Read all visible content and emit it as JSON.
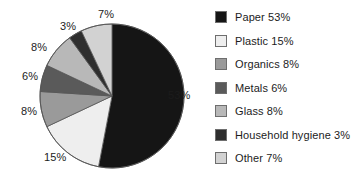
{
  "chart_data": {
    "type": "pie",
    "title": "",
    "subtitle": "",
    "xlabel": "",
    "ylabel": "",
    "legend_position": "right",
    "grid": false,
    "start_angle_deg": 0,
    "direction": "clockwise",
    "unit": "%",
    "categories": [
      "Paper",
      "Plastic",
      "Organics",
      "Metals",
      "Glass",
      "Household hygiene",
      "Other"
    ],
    "values": [
      53,
      15,
      8,
      6,
      8,
      3,
      7
    ],
    "total": 100,
    "colors": [
      "#151515",
      "#eeeeee",
      "#9a9a9a",
      "#5a5a5a",
      "#b8b8b8",
      "#2e2e2e",
      "#d2d2d2"
    ],
    "slices": [
      {
        "label": "Paper",
        "value": 53,
        "value_text": "53%",
        "color": "#151515"
      },
      {
        "label": "Plastic",
        "value": 15,
        "value_text": "15%",
        "color": "#eeeeee"
      },
      {
        "label": "Organics",
        "value": 8,
        "value_text": "8%",
        "color": "#9a9a9a"
      },
      {
        "label": "Metals",
        "value": 6,
        "value_text": "6%",
        "color": "#5a5a5a"
      },
      {
        "label": "Glass",
        "value": 8,
        "value_text": "8%",
        "color": "#b8b8b8"
      },
      {
        "label": "Household hygiene",
        "value": 3,
        "value_text": "3%",
        "color": "#2e2e2e"
      },
      {
        "label": "Other",
        "value": 7,
        "value_text": "7%",
        "color": "#d2d2d2"
      }
    ],
    "data_labels": [
      "53%",
      "15%",
      "8%",
      "6%",
      "8%",
      "3%",
      "7%"
    ],
    "legend_entries": [
      {
        "text": "Paper 53%",
        "color": "#151515"
      },
      {
        "text": "Plastic 15%",
        "color": "#eeeeee"
      },
      {
        "text": "Organics 8%",
        "color": "#9a9a9a"
      },
      {
        "text": "Metals 6%",
        "color": "#5a5a5a"
      },
      {
        "text": "Glass 8%",
        "color": "#b8b8b8"
      },
      {
        "text": "Household hygiene 3%",
        "color": "#2e2e2e"
      },
      {
        "text": "Other 7%",
        "color": "#d2d2d2"
      }
    ]
  },
  "pie_geometry": {
    "cx": 112,
    "cy": 96,
    "r": 72,
    "outline_color": "#555555"
  }
}
